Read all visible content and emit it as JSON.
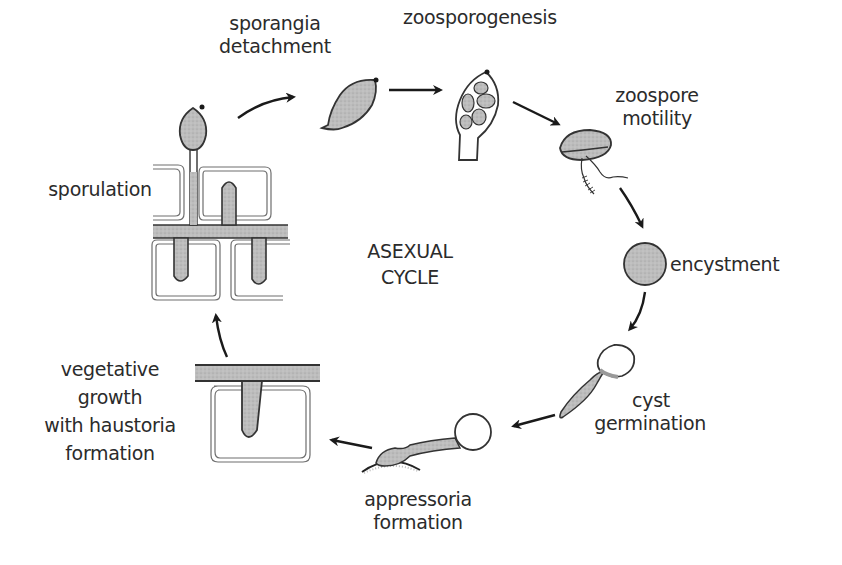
{
  "diagram": {
    "title": "ASEXUAL CYCLE",
    "center_label": {
      "line1": "ASEXUAL",
      "line2": "CYCLE"
    },
    "stages": [
      {
        "id": "sporangia-detachment",
        "line1": "sporangia",
        "line2": "detachment"
      },
      {
        "id": "zoosporogenesis",
        "line1": "zoosporogenesis"
      },
      {
        "id": "zoospore-motility",
        "line1": "zoospore",
        "line2": "motility"
      },
      {
        "id": "encystment",
        "line1": "encystment"
      },
      {
        "id": "cyst-germination",
        "line1": "cyst",
        "line2": "germination"
      },
      {
        "id": "appressoria-formation",
        "line1": "appressoria",
        "line2": "formation"
      },
      {
        "id": "vegetative-growth",
        "line1": "vegetative",
        "line2": "growth",
        "line3": "with haustoria",
        "line4": "formation"
      },
      {
        "id": "sporulation",
        "line1": "sporulation"
      }
    ],
    "flow": [
      "sporulation -> sporangia detachment",
      "sporangia detachment -> zoosporogenesis",
      "zoosporogenesis -> zoospore motility",
      "zoospore motility -> encystment",
      "encystment -> cyst germination",
      "cyst germination -> appressoria formation",
      "appressoria formation -> vegetative growth with haustoria formation",
      "vegetative growth with haustoria formation -> sporulation"
    ],
    "colors": {
      "ink": "#2b2b2b",
      "fill": "#b9b9b9",
      "background": "#ffffff"
    }
  }
}
